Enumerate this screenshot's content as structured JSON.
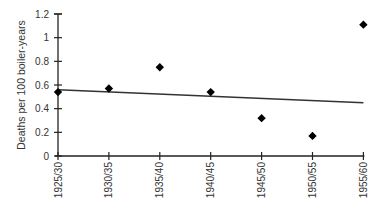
{
  "chart_data": {
    "type": "scatter",
    "title": "",
    "xlabel": "",
    "ylabel": "Deaths per 100 boiler-years",
    "categories": [
      "1925/30",
      "1930/35",
      "1935/40",
      "1940/45",
      "1945/50",
      "1950/55",
      "1955/60"
    ],
    "series": [
      {
        "name": "Deaths",
        "marker": "diamond",
        "values": [
          0.54,
          0.57,
          0.75,
          0.54,
          0.32,
          0.17,
          1.11
        ]
      }
    ],
    "trendline": {
      "type": "linear",
      "start": {
        "x": "1925/30",
        "y": 0.56
      },
      "end": {
        "x": "1955/60",
        "y": 0.45
      }
    },
    "ylim": [
      0,
      1.2
    ],
    "yticks": [
      0,
      0.2,
      0.4,
      0.6,
      0.8,
      1,
      1.2
    ],
    "ytick_labels": [
      "0",
      "0.2",
      "0.4",
      "0.6",
      "0.8",
      "1",
      "1.2"
    ],
    "grid": false,
    "legend": "none",
    "colors": {
      "marker": "#000000",
      "line": "#333333",
      "axis": "#222222"
    }
  }
}
